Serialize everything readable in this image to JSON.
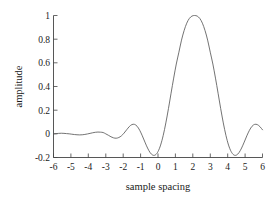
{
  "chart_data": {
    "type": "line",
    "title": "",
    "xlabel": "sample spacing",
    "ylabel": "amplitude",
    "xlim": [
      -6,
      6
    ],
    "ylim": [
      -0.2,
      1.0
    ],
    "xticks": [
      -6,
      -5,
      -4,
      -3,
      -2,
      -1,
      0,
      1,
      2,
      3,
      4,
      5,
      6
    ],
    "xtick_labels": [
      "-6",
      "-5",
      "-4",
      "-3",
      "-2",
      "-1",
      "0",
      "1",
      "2",
      "3",
      "4",
      "5",
      "6"
    ],
    "yticks": [
      -0.2,
      0,
      0.2,
      0.4,
      0.6,
      0.8,
      1
    ],
    "ytick_labels": [
      "-0.2",
      "0",
      "0.2",
      "0.4",
      "0.6",
      "0.8",
      "1"
    ],
    "grid": false,
    "legend": null,
    "series": [
      {
        "name": "windowed sinc interpolation kernel",
        "color": "#5a5a5a",
        "x": [
          -6.0,
          -5.85,
          -5.7,
          -5.55,
          -5.4,
          -5.25,
          -5.1,
          -4.95,
          -4.8,
          -4.65,
          -4.5,
          -4.35,
          -4.2,
          -4.05,
          -3.9,
          -3.75,
          -3.6,
          -3.45,
          -3.3,
          -3.15,
          -3.0,
          -2.85,
          -2.7,
          -2.55,
          -2.4,
          -2.25,
          -2.1,
          -1.95,
          -1.8,
          -1.65,
          -1.5,
          -1.35,
          -1.2,
          -1.05,
          -0.9,
          -0.75,
          -0.6,
          -0.45,
          -0.3,
          -0.15,
          0.0,
          0.15,
          0.3,
          0.45,
          0.6,
          0.75,
          0.9,
          1.05,
          1.2,
          1.35,
          1.5,
          1.65,
          1.8,
          1.95,
          2.1,
          2.25,
          2.4,
          2.55,
          2.7,
          2.85,
          3.0,
          3.15,
          3.3,
          3.45,
          3.6,
          3.75,
          3.9,
          4.05,
          4.2,
          4.35,
          4.5,
          4.65,
          4.8,
          4.95,
          5.1,
          5.25,
          5.4,
          5.55,
          5.7,
          5.85,
          6.0
        ],
        "y": [
          0.0,
          0.002,
          0.004,
          0.005,
          0.004,
          0.002,
          0.0,
          -0.003,
          -0.006,
          -0.008,
          -0.009,
          -0.008,
          -0.005,
          -0.001,
          0.004,
          0.009,
          0.013,
          0.015,
          0.014,
          0.011,
          0.0,
          -0.012,
          -0.025,
          -0.034,
          -0.037,
          -0.031,
          -0.017,
          0.006,
          0.034,
          0.061,
          0.078,
          0.08,
          0.064,
          0.03,
          -0.017,
          -0.07,
          -0.12,
          -0.159,
          -0.18,
          -0.178,
          -0.15,
          -0.095,
          -0.013,
          0.092,
          0.213,
          0.343,
          0.471,
          0.59,
          0.69,
          0.792,
          0.873,
          0.935,
          0.975,
          0.995,
          1.0,
          0.995,
          0.975,
          0.935,
          0.873,
          0.792,
          0.69,
          0.59,
          0.471,
          0.343,
          0.213,
          0.092,
          -0.013,
          -0.095,
          -0.15,
          -0.178,
          -0.18,
          -0.159,
          -0.12,
          -0.07,
          -0.017,
          0.03,
          0.064,
          0.08,
          0.078,
          0.061,
          0.034
        ],
        "key_points": {
          "main_peak": {
            "x": 0,
            "y": 1.0
          },
          "first_nulls": [
            -1.0,
            1.0
          ],
          "first_minima": [
            {
              "x": -1.35,
              "y": -0.19
            },
            {
              "x": 1.35,
              "y": -0.19
            }
          ],
          "first_sidelobe_peaks": [
            {
              "x": -2.4,
              "y": 0.078
            },
            {
              "x": 2.4,
              "y": 0.078
            }
          ],
          "second_sidelobe_peaks": [
            {
              "x": -4.4,
              "y": 0.02
            },
            {
              "x": 4.4,
              "y": 0.02
            }
          ],
          "tails": {
            "x": [
              -6,
              6
            ],
            "y": 0.0
          }
        }
      }
    ],
    "colors": {
      "background": "#ffffff",
      "axis": "#444444",
      "curve": "#5a5a5a",
      "text": "#1a1a1a"
    }
  }
}
